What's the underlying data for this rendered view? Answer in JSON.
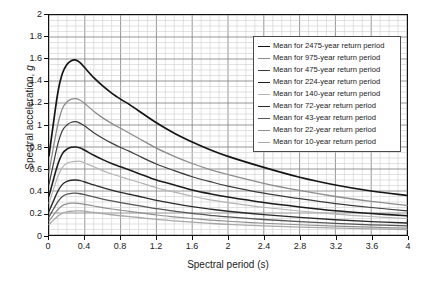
{
  "chart_data": {
    "type": "line",
    "title": "",
    "xlabel": "Spectral period (s)",
    "ylabel": "Spectral acceleration, g",
    "ylabel_plain": "Spectral acceleration,",
    "ylabel_italic": "g",
    "xlim": [
      0,
      4
    ],
    "ylim": [
      0,
      2
    ],
    "xticks": [
      0,
      0.4,
      0.8,
      1.2,
      1.6,
      2,
      2.4,
      2.8,
      3.2,
      3.6,
      4
    ],
    "xticklabels": [
      "0",
      "0.4",
      "0.8",
      "1.2",
      "1.6",
      "2",
      "2.4",
      "2.8",
      "3.2",
      "3.6",
      "4"
    ],
    "yticks": [
      0,
      0.2,
      0.4,
      0.6,
      0.8,
      1,
      1.2,
      1.4,
      1.6,
      1.8,
      2
    ],
    "yticklabels": [
      "0",
      "0.2",
      "0.4",
      "0.6",
      "0.8",
      "1",
      "1.2",
      "1.4",
      "1.6",
      "1.8",
      "2"
    ],
    "x_minor_step": 0.1,
    "y_minor_step": 0.05,
    "grid": true,
    "legend_position": "upper right",
    "x": [
      0,
      0.05,
      0.1,
      0.15,
      0.2,
      0.25,
      0.3,
      0.35,
      0.4,
      0.5,
      0.6,
      0.7,
      0.8,
      0.9,
      1.0,
      1.2,
      1.4,
      1.6,
      1.8,
      2.0,
      2.4,
      2.8,
      3.2,
      3.6,
      4.0
    ],
    "series": [
      {
        "name": "Mean for 2475-year return period",
        "label": "Mean for 2475-year return period",
        "return_period_years": 2475,
        "color": "#141414",
        "width": 1.7,
        "peak": 1.59,
        "peak_period": 0.3,
        "values": [
          0.72,
          1.02,
          1.3,
          1.47,
          1.55,
          1.585,
          1.59,
          1.565,
          1.52,
          1.43,
          1.355,
          1.29,
          1.235,
          1.185,
          1.13,
          1.02,
          0.925,
          0.845,
          0.775,
          0.715,
          0.615,
          0.525,
          0.455,
          0.4,
          0.36
        ]
      },
      {
        "name": "Mean for 975-year return period",
        "label": "Mean for 975-year return period",
        "return_period_years": 975,
        "color": "#8c8c8c",
        "width": 1.3,
        "peak": 1.24,
        "peak_period": 0.3,
        "values": [
          0.57,
          0.8,
          1.01,
          1.15,
          1.21,
          1.235,
          1.24,
          1.225,
          1.195,
          1.125,
          1.065,
          1.015,
          0.97,
          0.925,
          0.88,
          0.79,
          0.715,
          0.65,
          0.595,
          0.55,
          0.47,
          0.405,
          0.35,
          0.305,
          0.27
        ]
      },
      {
        "name": "Mean for 475-year return period",
        "label": "Mean for 475-year return period",
        "return_period_years": 475,
        "color": "#3c3c3c",
        "width": 1.2,
        "peak": 1.03,
        "peak_period": 0.3,
        "values": [
          0.46,
          0.65,
          0.83,
          0.95,
          1.0,
          1.025,
          1.03,
          1.015,
          0.99,
          0.93,
          0.88,
          0.835,
          0.795,
          0.76,
          0.72,
          0.645,
          0.585,
          0.53,
          0.485,
          0.445,
          0.38,
          0.33,
          0.285,
          0.25,
          0.22
        ]
      },
      {
        "name": "Mean for 224-year return period",
        "label": "Mean for 224-year return period",
        "return_period_years": 224,
        "color": "#1c1c1c",
        "width": 1.6,
        "peak": 0.8,
        "peak_period": 0.3,
        "values": [
          0.355,
          0.505,
          0.645,
          0.74,
          0.78,
          0.797,
          0.8,
          0.79,
          0.77,
          0.725,
          0.685,
          0.65,
          0.62,
          0.59,
          0.56,
          0.5,
          0.455,
          0.41,
          0.375,
          0.345,
          0.295,
          0.255,
          0.22,
          0.195,
          0.175
        ]
      },
      {
        "name": "Mean for 140-year return period",
        "label": "Mean for 140-year return period",
        "return_period_years": 140,
        "color": "#b4b4b4",
        "width": 1.2,
        "peak": 0.67,
        "peak_period": 0.32,
        "values": [
          0.29,
          0.415,
          0.535,
          0.615,
          0.652,
          0.665,
          0.669,
          0.67,
          0.655,
          0.62,
          0.585,
          0.555,
          0.53,
          0.505,
          0.48,
          0.43,
          0.39,
          0.352,
          0.32,
          0.295,
          0.252,
          0.218,
          0.19,
          0.168,
          0.15
        ]
      },
      {
        "name": "Mean for 72-year return period",
        "label": "Mean for 72-year return period",
        "return_period_years": 72,
        "color": "#2a2a2a",
        "width": 1.4,
        "peak": 0.5,
        "peak_period": 0.3,
        "values": [
          0.215,
          0.31,
          0.4,
          0.46,
          0.488,
          0.498,
          0.5,
          0.494,
          0.482,
          0.455,
          0.43,
          0.408,
          0.388,
          0.37,
          0.352,
          0.315,
          0.285,
          0.258,
          0.235,
          0.216,
          0.185,
          0.16,
          0.139,
          0.122,
          0.109
        ]
      },
      {
        "name": "Mean for 43-year return period",
        "label": "Mean for 43-year return period",
        "return_period_years": 43,
        "color": "#555555",
        "width": 1.3,
        "peak": 0.38,
        "peak_period": 0.3,
        "values": [
          0.165,
          0.236,
          0.304,
          0.35,
          0.371,
          0.379,
          0.38,
          0.375,
          0.366,
          0.346,
          0.327,
          0.31,
          0.295,
          0.281,
          0.267,
          0.239,
          0.217,
          0.196,
          0.179,
          0.164,
          0.141,
          0.122,
          0.106,
          0.093,
          0.083
        ]
      },
      {
        "name": "Mean for 22-year return period",
        "label": "Mean for 22-year return period",
        "return_period_years": 22,
        "color": "#909090",
        "width": 1.2,
        "peak": 0.29,
        "peak_period": 0.3,
        "values": [
          0.126,
          0.18,
          0.232,
          0.267,
          0.283,
          0.289,
          0.29,
          0.286,
          0.279,
          0.264,
          0.249,
          0.236,
          0.225,
          0.214,
          0.204,
          0.182,
          0.165,
          0.15,
          0.136,
          0.125,
          0.107,
          0.093,
          0.081,
          0.071,
          0.063
        ]
      },
      {
        "name": "Mean for 10-year return period",
        "label": "Mean for 10-year return period",
        "return_period_years": 10,
        "color": "#a8a8a8",
        "width": 1.3,
        "peak": 0.22,
        "peak_period": 0.35,
        "values": [
          0.096,
          0.135,
          0.172,
          0.198,
          0.21,
          0.216,
          0.219,
          0.22,
          0.216,
          0.205,
          0.194,
          0.184,
          0.175,
          0.167,
          0.159,
          0.142,
          0.129,
          0.117,
          0.106,
          0.097,
          0.083,
          0.072,
          0.063,
          0.055,
          0.049
        ]
      }
    ]
  },
  "legend": {
    "items": [
      "Mean for 2475-year return period",
      "Mean for 975-year return period",
      "Mean for 475-year return period",
      "Mean for 224-year return period",
      "Mean for 140-year return period",
      "Mean for 72-year return period",
      "Mean for 43-year return period",
      "Mean for 22-year return period",
      "Mean for 10-year return period"
    ]
  },
  "colors": {
    "axis": "#111111",
    "grid_minor": "#c9c9c9",
    "grid_major": "#8a8a8a",
    "background": "#ffffff",
    "legend_border": "#4a4a4a"
  }
}
